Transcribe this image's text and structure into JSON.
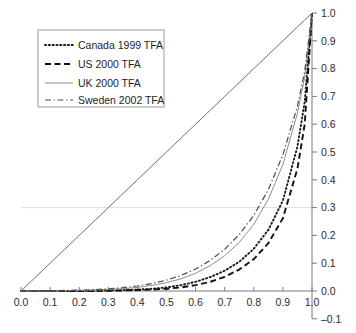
{
  "chart_data": {
    "type": "line",
    "title": "",
    "subtitle": "",
    "xlabel": "",
    "ylabel": "",
    "xlim": [
      0.0,
      1.0
    ],
    "ylim": [
      -0.1,
      1.0
    ],
    "grid": "single faint horizontal line at y=0.3",
    "legend_position": "top-left",
    "x_ticks": [
      "0.0",
      "0.1",
      "0.2",
      "0.3",
      "0.4",
      "0.5",
      "0.6",
      "0.7",
      "0.8",
      "0.9",
      "1.0"
    ],
    "x_tick_values": [
      0.0,
      0.1,
      0.2,
      0.3,
      0.4,
      0.5,
      0.6,
      0.7,
      0.8,
      0.9,
      1.0
    ],
    "y_ticks": [
      "-0.1",
      "0.0",
      "0.1",
      "0.2",
      "0.3",
      "0.4",
      "0.5",
      "0.6",
      "0.7",
      "0.8",
      "0.9",
      "1.0"
    ],
    "y_tick_values": [
      -0.1,
      0.0,
      0.1,
      0.2,
      0.3,
      0.4,
      0.5,
      0.6,
      0.7,
      0.8,
      0.9,
      1.0
    ],
    "y_axis_side": "right",
    "x": [
      0.0,
      0.05,
      0.1,
      0.15,
      0.2,
      0.25,
      0.3,
      0.35,
      0.4,
      0.45,
      0.5,
      0.55,
      0.6,
      0.65,
      0.7,
      0.75,
      0.8,
      0.85,
      0.9,
      0.95,
      0.975,
      1.0
    ],
    "series": [
      {
        "name": "Canada 1999 TFA",
        "label": "Canada 1999 TFA",
        "style": "dotted",
        "color": "#1a1a1a",
        "values": [
          0.0,
          0.0,
          0.0,
          0.0,
          0.0,
          0.001,
          0.002,
          0.003,
          0.005,
          0.008,
          0.013,
          0.021,
          0.033,
          0.05,
          0.073,
          0.105,
          0.152,
          0.22,
          0.325,
          0.52,
          0.68,
          1.0
        ]
      },
      {
        "name": "US 2000 TFA",
        "label": "US 2000 TFA",
        "style": "dashed",
        "color": "#111111",
        "values": [
          0.0,
          0.0,
          0.0,
          0.0,
          0.0,
          0.0,
          0.001,
          0.002,
          0.003,
          0.005,
          0.008,
          0.013,
          0.021,
          0.033,
          0.051,
          0.077,
          0.115,
          0.172,
          0.262,
          0.44,
          0.6,
          1.0
        ]
      },
      {
        "name": "UK 2000 TFA",
        "label": "UK 2000 TFA",
        "style": "solid",
        "color": "#8d8d8d",
        "values": [
          0.0,
          0.0,
          0.0,
          0.001,
          0.002,
          0.003,
          0.005,
          0.008,
          0.013,
          0.02,
          0.03,
          0.044,
          0.064,
          0.091,
          0.127,
          0.175,
          0.24,
          0.33,
          0.455,
          0.64,
          0.77,
          1.0
        ]
      },
      {
        "name": "Sweden 2002 TFA",
        "label": "Sweden 2002 TFA",
        "style": "dashdot",
        "color": "#4a4a4a",
        "values": [
          0.0,
          0.0,
          0.001,
          0.002,
          0.003,
          0.005,
          0.008,
          0.012,
          0.018,
          0.027,
          0.039,
          0.056,
          0.079,
          0.11,
          0.15,
          0.203,
          0.272,
          0.365,
          0.49,
          0.665,
          0.79,
          1.0
        ]
      },
      {
        "name": "Equality line",
        "label": "",
        "style": "solid",
        "color": "#6e6e6e",
        "values": [
          0.0,
          0.05,
          0.1,
          0.15,
          0.2,
          0.25,
          0.3,
          0.35,
          0.4,
          0.45,
          0.5,
          0.55,
          0.6,
          0.65,
          0.7,
          0.75,
          0.8,
          0.85,
          0.9,
          0.95,
          0.975,
          1.0
        ]
      }
    ]
  },
  "legend": {
    "items": [
      {
        "label": "Canada 1999 TFA",
        "style": "dotted"
      },
      {
        "label": "US 2000 TFA",
        "style": "dashed"
      },
      {
        "label": "UK 2000 TFA",
        "style": "solid"
      },
      {
        "label": "Sweden 2002 TFA",
        "style": "dashdot"
      }
    ]
  }
}
